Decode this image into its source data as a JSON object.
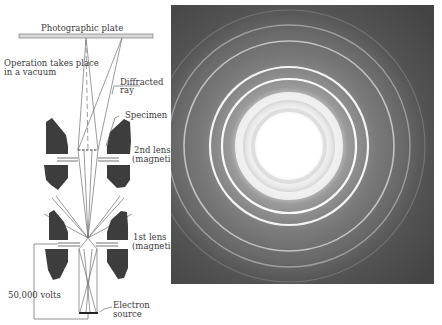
{
  "diagram": {
    "labels": {
      "plate": "Photographic plate",
      "vacuum_line1": "Operation takes place",
      "vacuum_line2": "in a vacuum",
      "diffracted_line1": "Diffracted",
      "diffracted_line2": "ray",
      "specimen": "Specimen",
      "lens2_line1": "2nd lens",
      "lens2_line2": "(magnetic)",
      "lens1_line1": "1st lens",
      "lens1_line2": "(magnetic)",
      "voltage": "50,000 volts",
      "source_line1": "Electron",
      "source_line2": "source"
    },
    "colors": {
      "lens": "#3d3d3d",
      "line": "#666666",
      "plate": "#9a9a9a"
    }
  },
  "photo": {
    "description": "Electron diffraction ring pattern",
    "center": [
      118,
      141
    ],
    "background": "#5f5f5f",
    "rings": [
      {
        "r": 50,
        "color": "#f4f4f4",
        "width": 8,
        "opacity": 0.9
      },
      {
        "r": 67,
        "color": "#ffffff",
        "width": 2.2,
        "opacity": 0.95
      },
      {
        "r": 79,
        "color": "#ffffff",
        "width": 2.2,
        "opacity": 0.9
      },
      {
        "r": 105,
        "color": "#dddddd",
        "width": 1.6,
        "opacity": 0.75
      },
      {
        "r": 121,
        "color": "#c8c8c8",
        "width": 1.4,
        "opacity": 0.6
      },
      {
        "r": 136,
        "color": "#aaaaaa",
        "width": 1.2,
        "opacity": 0.4
      }
    ]
  }
}
